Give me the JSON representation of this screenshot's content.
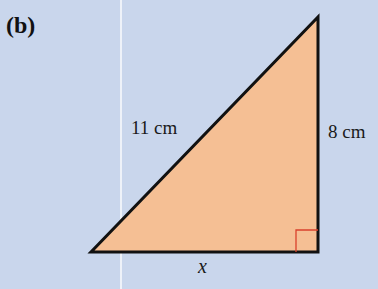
{
  "part_label": "(b)",
  "diagram": {
    "shape": "right-triangle",
    "fill_color": "#f5bf94",
    "stroke_color": "#111111",
    "right_angle_marker_color": "#d9412c",
    "background_color": "#c9d6ec",
    "vertices": {
      "top": [
        318,
        17
      ],
      "bottom_right": [
        318,
        252
      ],
      "bottom_left": [
        91,
        252
      ]
    },
    "labels": {
      "hypotenuse": "11 cm",
      "vertical_side": "8 cm",
      "base": "x"
    }
  }
}
